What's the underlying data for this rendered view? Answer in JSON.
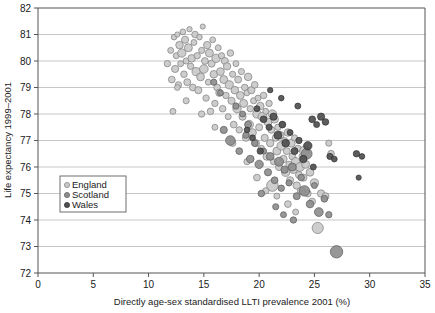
{
  "chart_data": {
    "type": "scatter",
    "title": "",
    "xlabel": "Directly age-sex standardised LLTI prevalence 2001 (%)",
    "ylabel": "Life expectancy 1999–2001",
    "xlim": [
      0,
      35
    ],
    "ylim": [
      72,
      82
    ],
    "xticks": [
      0,
      5,
      10,
      15,
      20,
      25,
      30,
      35
    ],
    "yticks": [
      72,
      73,
      74,
      75,
      76,
      77,
      78,
      79,
      80,
      81,
      82
    ],
    "xtick_labels": [
      "0",
      "5",
      "10",
      "15",
      "20",
      "25",
      "30",
      "35"
    ],
    "ytick_labels": [
      "72",
      "73",
      "74",
      "75",
      "76",
      "77",
      "78",
      "79",
      "80",
      "81",
      "82"
    ],
    "grid": "horizontal",
    "grid_color": "#b9b9b9",
    "axis_color": "#555555",
    "legend_position": "lower-left-inside",
    "marker_shape": "circle",
    "marker_size_varies": true,
    "series": [
      {
        "name": "England",
        "color": "#c9c9c9",
        "edge_color": "#7d7d7d",
        "points": [
          [
            11.7,
            79.9,
            3.2
          ],
          [
            12.0,
            80.4,
            3.0
          ],
          [
            12.1,
            79.3,
            3.4
          ],
          [
            12.3,
            80.9,
            2.8
          ],
          [
            12.4,
            79.7,
            3.6
          ],
          [
            12.5,
            80.2,
            3.0
          ],
          [
            12.6,
            81.0,
            2.6
          ],
          [
            12.7,
            79.1,
            3.2
          ],
          [
            12.8,
            80.6,
            3.8
          ],
          [
            12.9,
            79.9,
            3.0
          ],
          [
            13.0,
            80.3,
            4.2
          ],
          [
            13.1,
            81.1,
            2.9
          ],
          [
            13.2,
            79.5,
            3.3
          ],
          [
            13.3,
            80.8,
            3.6
          ],
          [
            13.4,
            80.0,
            3.1
          ],
          [
            13.5,
            79.2,
            3.5
          ],
          [
            13.6,
            80.5,
            4.0
          ],
          [
            13.7,
            81.2,
            2.7
          ],
          [
            13.8,
            79.8,
            3.2
          ],
          [
            13.9,
            80.1,
            3.8
          ],
          [
            14.0,
            79.0,
            3.4
          ],
          [
            14.1,
            80.7,
            3.0
          ],
          [
            14.2,
            81.0,
            3.3
          ],
          [
            14.3,
            79.6,
            4.1
          ],
          [
            14.4,
            80.2,
            3.2
          ],
          [
            14.5,
            78.9,
            3.6
          ],
          [
            14.6,
            80.9,
            2.8
          ],
          [
            14.7,
            79.4,
            3.9
          ],
          [
            14.8,
            80.4,
            3.1
          ],
          [
            14.9,
            81.3,
            2.6
          ],
          [
            15.0,
            79.7,
            4.3
          ],
          [
            15.1,
            80.0,
            3.4
          ],
          [
            15.2,
            78.6,
            3.2
          ],
          [
            15.3,
            80.6,
            3.7
          ],
          [
            15.4,
            79.2,
            3.0
          ],
          [
            15.5,
            80.3,
            4.0
          ],
          [
            15.6,
            78.1,
            3.3
          ],
          [
            15.7,
            79.9,
            3.5
          ],
          [
            15.8,
            80.8,
            2.9
          ],
          [
            15.9,
            79.5,
            3.8
          ],
          [
            16.0,
            78.4,
            3.2
          ],
          [
            16.1,
            80.1,
            4.2
          ],
          [
            16.2,
            79.0,
            3.4
          ],
          [
            16.3,
            80.5,
            3.0
          ],
          [
            16.4,
            78.8,
            3.6
          ],
          [
            16.5,
            79.6,
            3.9
          ],
          [
            16.6,
            80.2,
            3.1
          ],
          [
            16.7,
            78.2,
            3.3
          ],
          [
            16.8,
            79.3,
            4.0
          ],
          [
            16.9,
            80.0,
            3.5
          ],
          [
            17.0,
            78.7,
            3.2
          ],
          [
            17.1,
            79.8,
            3.7
          ],
          [
            17.2,
            77.9,
            3.0
          ],
          [
            17.3,
            79.1,
            4.1
          ],
          [
            17.4,
            80.3,
            3.3
          ],
          [
            17.5,
            78.5,
            3.6
          ],
          [
            17.6,
            79.5,
            3.1
          ],
          [
            17.7,
            77.6,
            3.4
          ],
          [
            17.8,
            78.9,
            3.8
          ],
          [
            17.9,
            79.9,
            3.0
          ],
          [
            18.0,
            78.2,
            4.2
          ],
          [
            18.1,
            79.3,
            3.5
          ],
          [
            18.2,
            77.4,
            3.2
          ],
          [
            18.3,
            78.7,
            3.9
          ],
          [
            18.4,
            79.6,
            3.1
          ],
          [
            18.5,
            77.9,
            3.6
          ],
          [
            18.6,
            78.4,
            4.0
          ],
          [
            18.7,
            79.0,
            3.3
          ],
          [
            18.8,
            77.1,
            3.5
          ],
          [
            18.9,
            78.8,
            3.0
          ],
          [
            19.0,
            79.4,
            3.8
          ],
          [
            19.1,
            77.6,
            4.3
          ],
          [
            19.2,
            78.2,
            3.2
          ],
          [
            19.3,
            78.9,
            3.6
          ],
          [
            19.4,
            77.3,
            3.9
          ],
          [
            19.5,
            78.5,
            3.1
          ],
          [
            19.6,
            79.1,
            3.4
          ],
          [
            19.7,
            76.9,
            3.7
          ],
          [
            19.8,
            78.0,
            4.1
          ],
          [
            19.9,
            78.6,
            3.0
          ],
          [
            20.0,
            77.5,
            3.5
          ],
          [
            20.1,
            78.3,
            3.8
          ],
          [
            20.2,
            76.7,
            3.2
          ],
          [
            20.3,
            77.9,
            4.4
          ],
          [
            20.4,
            78.7,
            3.3
          ],
          [
            20.5,
            77.1,
            3.6
          ],
          [
            20.6,
            78.1,
            3.0
          ],
          [
            20.7,
            76.4,
            3.9
          ],
          [
            20.8,
            77.7,
            4.0
          ],
          [
            20.9,
            78.4,
            3.2
          ],
          [
            21.0,
            76.9,
            3.7
          ],
          [
            21.1,
            77.4,
            3.4
          ],
          [
            21.2,
            78.0,
            4.2
          ],
          [
            21.3,
            76.2,
            3.1
          ],
          [
            21.4,
            77.8,
            3.8
          ],
          [
            21.5,
            77.1,
            3.5
          ],
          [
            21.6,
            76.6,
            4.0
          ],
          [
            21.7,
            77.5,
            3.2
          ],
          [
            21.8,
            76.0,
            3.6
          ],
          [
            21.9,
            77.2,
            3.9
          ],
          [
            22.0,
            76.8,
            4.3
          ],
          [
            22.1,
            77.6,
            3.3
          ],
          [
            22.2,
            76.3,
            3.7
          ],
          [
            22.3,
            77.0,
            3.0
          ],
          [
            22.4,
            75.8,
            4.1
          ],
          [
            22.5,
            76.6,
            3.5
          ],
          [
            22.6,
            77.3,
            3.8
          ],
          [
            22.7,
            76.1,
            3.2
          ],
          [
            22.8,
            75.5,
            3.6
          ],
          [
            22.9,
            76.9,
            4.0
          ],
          [
            23.0,
            76.4,
            3.4
          ],
          [
            23.1,
            75.9,
            3.9
          ],
          [
            23.2,
            77.1,
            3.1
          ],
          [
            23.3,
            76.2,
            4.2
          ],
          [
            23.4,
            75.3,
            3.7
          ],
          [
            23.5,
            76.7,
            3.3
          ],
          [
            23.6,
            75.7,
            3.5
          ],
          [
            23.7,
            76.0,
            4.4
          ],
          [
            23.8,
            75.1,
            3.8
          ],
          [
            23.9,
            76.4,
            3.2
          ],
          [
            24.0,
            75.6,
            3.6
          ],
          [
            24.2,
            76.1,
            4.0
          ],
          [
            24.4,
            75.0,
            3.4
          ],
          [
            24.6,
            75.8,
            3.9
          ],
          [
            24.8,
            74.7,
            3.3
          ],
          [
            25.0,
            75.4,
            4.1
          ],
          [
            25.3,
            73.7,
            5.6
          ],
          [
            25.6,
            75.0,
            3.7
          ],
          [
            26.0,
            74.9,
            3.5
          ],
          [
            26.5,
            76.5,
            3.4
          ],
          [
            21.2,
            75.3,
            5.8
          ],
          [
            22.6,
            74.6,
            3.4
          ],
          [
            23.3,
            74.3,
            3.0
          ],
          [
            24.1,
            76.6,
            4.9
          ],
          [
            26.3,
            76.9,
            3.1
          ],
          [
            12.2,
            78.1,
            3.0
          ],
          [
            12.6,
            79.0,
            2.9
          ],
          [
            13.4,
            78.5,
            3.1
          ],
          [
            14.8,
            78.0,
            3.2
          ],
          [
            16.0,
            77.5,
            3.0
          ],
          [
            17.6,
            76.9,
            3.3
          ],
          [
            18.9,
            76.2,
            3.1
          ],
          [
            19.8,
            75.6,
            3.4
          ],
          [
            20.6,
            75.1,
            3.2
          ],
          [
            21.6,
            74.9,
            3.0
          ]
        ]
      },
      {
        "name": "Scotland",
        "color": "#8e8e8e",
        "edge_color": "#5a5a5a",
        "points": [
          [
            16.8,
            77.4,
            3.6
          ],
          [
            17.4,
            77.0,
            4.8
          ],
          [
            18.2,
            76.6,
            3.4
          ],
          [
            18.8,
            77.2,
            3.1
          ],
          [
            19.2,
            76.3,
            3.8
          ],
          [
            19.6,
            76.9,
            3.3
          ],
          [
            20.0,
            76.1,
            4.2
          ],
          [
            20.4,
            76.6,
            3.0
          ],
          [
            20.8,
            75.8,
            3.6
          ],
          [
            21.0,
            76.4,
            3.9
          ],
          [
            21.4,
            75.5,
            3.4
          ],
          [
            21.8,
            76.2,
            4.5
          ],
          [
            22.0,
            75.2,
            3.2
          ],
          [
            22.3,
            75.9,
            3.7
          ],
          [
            22.7,
            75.4,
            3.1
          ],
          [
            23.0,
            76.0,
            4.0
          ],
          [
            23.4,
            74.9,
            3.5
          ],
          [
            23.8,
            75.6,
            3.3
          ],
          [
            24.1,
            75.1,
            5.2
          ],
          [
            24.6,
            74.6,
            3.8
          ],
          [
            25.0,
            75.3,
            3.0
          ],
          [
            25.4,
            74.3,
            4.4
          ],
          [
            25.9,
            74.8,
            3.4
          ],
          [
            26.3,
            74.2,
            3.2
          ],
          [
            27.0,
            72.8,
            6.2
          ],
          [
            24.3,
            76.5,
            5.4
          ],
          [
            22.2,
            74.2,
            3.0
          ],
          [
            23.1,
            74.0,
            3.2
          ],
          [
            21.5,
            74.5,
            3.1
          ],
          [
            20.2,
            75.0,
            3.3
          ],
          [
            18.5,
            78.0,
            3.0
          ],
          [
            19.0,
            77.6,
            3.4
          ],
          [
            17.9,
            78.3,
            3.2
          ],
          [
            16.5,
            78.8,
            3.0
          ],
          [
            15.9,
            79.2,
            3.1
          ]
        ]
      },
      {
        "name": "Wales",
        "color": "#4f4f4f",
        "edge_color": "#303030",
        "points": [
          [
            19.8,
            78.2,
            3.0
          ],
          [
            20.4,
            77.8,
            3.4
          ],
          [
            20.9,
            77.5,
            3.1
          ],
          [
            21.3,
            77.9,
            3.6
          ],
          [
            21.7,
            77.2,
            4.0
          ],
          [
            22.1,
            77.6,
            3.3
          ],
          [
            22.4,
            76.9,
            3.8
          ],
          [
            22.8,
            77.3,
            3.0
          ],
          [
            23.2,
            76.6,
            3.5
          ],
          [
            23.6,
            77.0,
            3.2
          ],
          [
            24.0,
            76.3,
            3.7
          ],
          [
            24.4,
            76.8,
            4.2
          ],
          [
            24.8,
            77.8,
            3.4
          ],
          [
            25.2,
            77.6,
            3.0
          ],
          [
            25.6,
            77.9,
            3.6
          ],
          [
            26.0,
            77.7,
            3.3
          ],
          [
            26.4,
            76.4,
            3.1
          ],
          [
            26.8,
            76.3,
            2.9
          ],
          [
            28.8,
            76.5,
            3.2
          ],
          [
            29.3,
            76.4,
            2.8
          ],
          [
            29.0,
            75.6,
            2.6
          ],
          [
            22.0,
            78.6,
            2.8
          ],
          [
            23.5,
            78.3,
            3.0
          ],
          [
            21.0,
            78.9,
            2.7
          ],
          [
            24.9,
            76.0,
            3.0
          ],
          [
            20.1,
            76.6,
            3.2
          ],
          [
            19.4,
            77.1,
            3.0
          ],
          [
            18.9,
            77.4,
            2.8
          ]
        ]
      }
    ],
    "legend_entries": [
      {
        "label": "England",
        "color": "#c9c9c9"
      },
      {
        "label": "Scotland",
        "color": "#8e8e8e"
      },
      {
        "label": "Wales",
        "color": "#4f4f4f"
      }
    ]
  }
}
